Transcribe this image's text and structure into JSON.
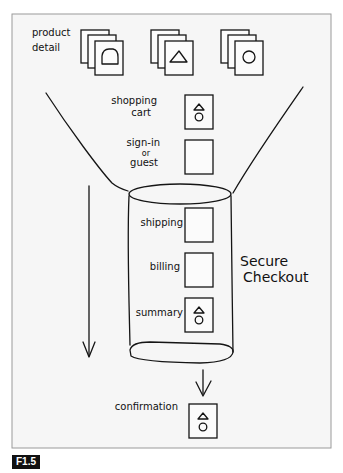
{
  "figure": {
    "label": "F1.5",
    "paper_color": "#f6f6f6",
    "ink_color": "#151515"
  },
  "product_detail": {
    "label_line1": "product",
    "label_line2": "detail",
    "stacks": [
      {
        "shape": "dome-icon"
      },
      {
        "shape": "triangle-icon"
      },
      {
        "shape": "circle-icon"
      }
    ]
  },
  "funnel": {
    "steps": [
      {
        "label_lines": [
          "shopping",
          "cart"
        ],
        "thumbnail": "triangle-circle-icon"
      },
      {
        "label_lines": [
          "sign-in",
          "or",
          "guest"
        ],
        "thumbnail": "blank"
      }
    ]
  },
  "secure_checkout": {
    "label_line1": "Secure",
    "label_line2": "Checkout",
    "steps": [
      {
        "label": "shipping",
        "thumbnail": "blank"
      },
      {
        "label": "billing",
        "thumbnail": "blank"
      },
      {
        "label": "summary",
        "thumbnail": "triangle-circle-icon"
      }
    ]
  },
  "confirmation": {
    "label": "confirmation",
    "thumbnail": "triangle-circle-icon"
  }
}
